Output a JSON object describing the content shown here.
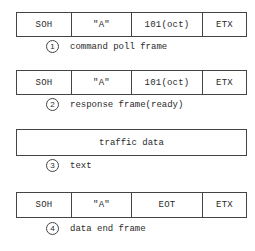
{
  "frames": [
    {
      "number": "1",
      "fields": [
        "SOH",
        "\"A\"",
        "101(oct)",
        "ETX"
      ],
      "caption": "command poll frame"
    },
    {
      "number": "2",
      "fields": [
        "SOH",
        "\"A\"",
        "101(oct)",
        "ETX"
      ],
      "caption": "response frame(ready)"
    },
    {
      "number": "3",
      "fields": [
        "traffic data"
      ],
      "caption": "text"
    },
    {
      "number": "4",
      "fields": [
        "SOH",
        "\"A\"",
        "EOT",
        "ETX"
      ],
      "caption": "data end frame"
    }
  ]
}
